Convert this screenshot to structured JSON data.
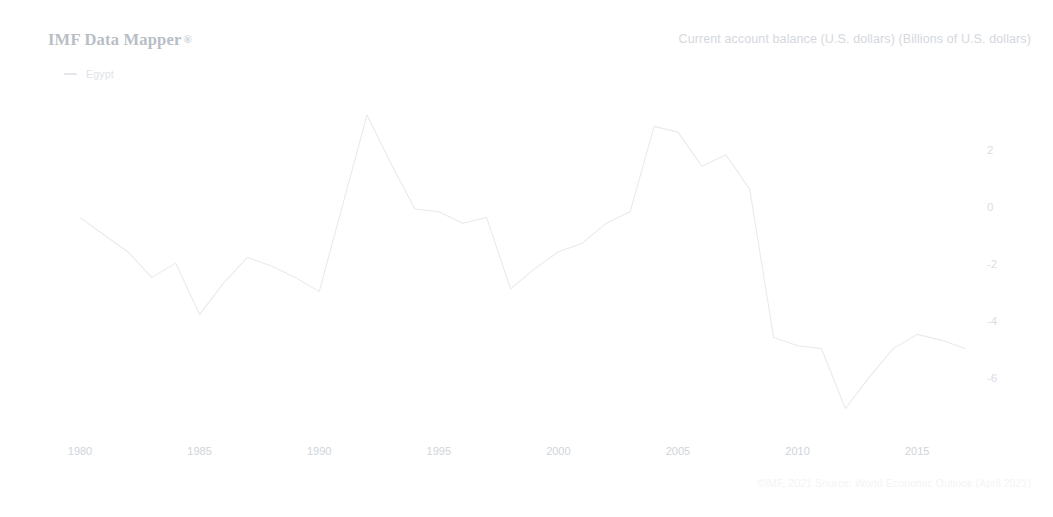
{
  "header": {
    "title": "IMF Data Mapper",
    "registered_mark": "®",
    "subtitle": "Current account balance (U.S. dollars) (Billions of U.S. dollars)"
  },
  "legend": {
    "position": "top-left",
    "entries": [
      {
        "label": "Egypt",
        "color": "#e2e5e9"
      }
    ]
  },
  "footer": {
    "source": "©IMF, 2021 Source: World Economic Outlook (April 2021)"
  },
  "colors": {
    "line": "#e7eaee",
    "axis_text": "#d3d8de",
    "title_text": "#b9bec6",
    "subtitle_text": "#d4d8de",
    "background": "#ffffff"
  },
  "chart_data": {
    "type": "line",
    "title": "Current account balance (U.S. dollars) (Billions of U.S. dollars)",
    "xlabel": "",
    "ylabel": "",
    "grid": false,
    "legend_position": "top-left",
    "xlim": [
      1980,
      2017
    ],
    "ylim": [
      -7.4,
      3.6
    ],
    "x_ticks": [
      1980,
      1985,
      1990,
      1995,
      2000,
      2005,
      2010,
      2015
    ],
    "y_ticks": [
      2,
      0,
      -2,
      -4,
      -6
    ],
    "x_tick_labels": [
      "1980",
      "1985",
      "1990",
      "1995",
      "2000",
      "2005",
      "2010",
      "2015"
    ],
    "y_tick_labels": [
      "2",
      "0",
      "-2",
      "-4",
      "-6"
    ],
    "series": [
      {
        "name": "Egypt",
        "color": "#e7eaee",
        "x": [
          1980,
          1981,
          1982,
          1983,
          1984,
          1985,
          1986,
          1987,
          1988,
          1989,
          1990,
          1991,
          1992,
          1993,
          1994,
          1995,
          1996,
          1997,
          1998,
          1999,
          2000,
          2001,
          2002,
          2003,
          2004,
          2005,
          2006,
          2007,
          2008,
          2009,
          2010,
          2011,
          2012,
          2013,
          2014,
          2015,
          2016,
          2017
        ],
        "values": [
          -0.3,
          -0.9,
          -1.5,
          -2.4,
          -1.9,
          -3.7,
          -2.6,
          -1.7,
          -2.0,
          -2.4,
          -2.9,
          0.2,
          3.3,
          1.6,
          0.0,
          -0.1,
          -0.5,
          -0.3,
          -2.8,
          -2.1,
          -1.5,
          -1.2,
          -0.5,
          -0.1,
          2.9,
          2.7,
          1.5,
          1.9,
          0.7,
          -4.5,
          -4.8,
          -4.9,
          -7.0,
          -5.9,
          -4.9,
          -4.4,
          -4.6,
          -4.9
        ]
      }
    ]
  }
}
